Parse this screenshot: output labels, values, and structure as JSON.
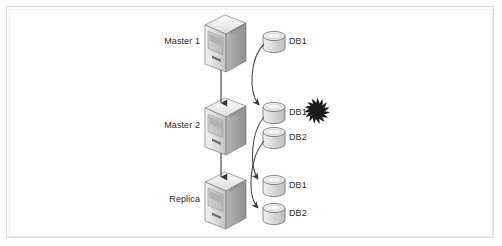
{
  "figure": {
    "background_color": "#ffffff",
    "frame_color": "#d9d9d9"
  },
  "palette": {
    "server_light": "#e9e9e9",
    "server_mid": "#cfcfcf",
    "server_dark": "#9e9e9e",
    "server_outline": "#6e6e6e",
    "db_fill": "#e2e2e2",
    "db_top": "#f2f2f2",
    "db_outline": "#6e6e6e",
    "connector": "#4a4a4a",
    "burst": "#1b1b1b",
    "text": "#2b2b2b"
  },
  "nodes": [
    {
      "id": "master1",
      "label": "Master 1",
      "icon": "server-tower-icon",
      "label_x": 168,
      "label_y": 36,
      "icon_x": 203,
      "icon_y": 14
    },
    {
      "id": "master2",
      "label": "Master 2",
      "icon": "server-tower-icon",
      "label_x": 168,
      "label_y": 120,
      "icon_x": 203,
      "icon_y": 97
    },
    {
      "id": "replica",
      "label": "Replica",
      "icon": "server-tower-icon",
      "label_x": 174,
      "label_y": 194,
      "icon_x": 203,
      "icon_y": 171
    }
  ],
  "databases": [
    {
      "id": "m1-db1",
      "label": "DB1",
      "owner": "master1",
      "icon": "database-cylinder-icon",
      "icon_x": 262,
      "icon_y": 31,
      "label_x": 287,
      "label_y": 37
    },
    {
      "id": "m2-db1",
      "label": "DB1",
      "owner": "master2",
      "icon": "database-cylinder-icon",
      "icon_x": 262,
      "icon_y": 102,
      "label_x": 287,
      "label_y": 108
    },
    {
      "id": "m2-db2",
      "label": "DB2",
      "owner": "master2",
      "icon": "database-cylinder-icon",
      "icon_x": 262,
      "icon_y": 127,
      "label_x": 287,
      "label_y": 133
    },
    {
      "id": "rep-db1",
      "label": "DB1",
      "owner": "replica",
      "icon": "database-cylinder-icon",
      "icon_x": 262,
      "icon_y": 175,
      "label_x": 287,
      "label_y": 181
    },
    {
      "id": "rep-db2",
      "label": "DB2",
      "owner": "replica",
      "icon": "database-cylinder-icon",
      "icon_x": 262,
      "icon_y": 203,
      "label_x": 287,
      "label_y": 209
    }
  ],
  "connectors": [
    {
      "id": "master1-to-master2",
      "kind": "vertical-arrow",
      "from": "master1",
      "to": "master2"
    },
    {
      "id": "master2-to-replica",
      "kind": "vertical-arrow",
      "from": "master2",
      "to": "replica"
    },
    {
      "id": "m1db1-to-m2db1",
      "kind": "curved-arrow",
      "from": "m1-db1",
      "to": "m2-db1"
    },
    {
      "id": "m2db1-to-repdb1",
      "kind": "curved-arrow",
      "from": "m2-db1",
      "to": "rep-db1"
    },
    {
      "id": "m2db2-to-repdb2",
      "kind": "curved-arrow",
      "from": "m2-db2",
      "to": "rep-db2"
    }
  ],
  "annotations": [
    {
      "id": "failure-burst",
      "icon": "explosion-burst-icon",
      "target": "m2-db1",
      "x": 304,
      "y": 98
    }
  ]
}
